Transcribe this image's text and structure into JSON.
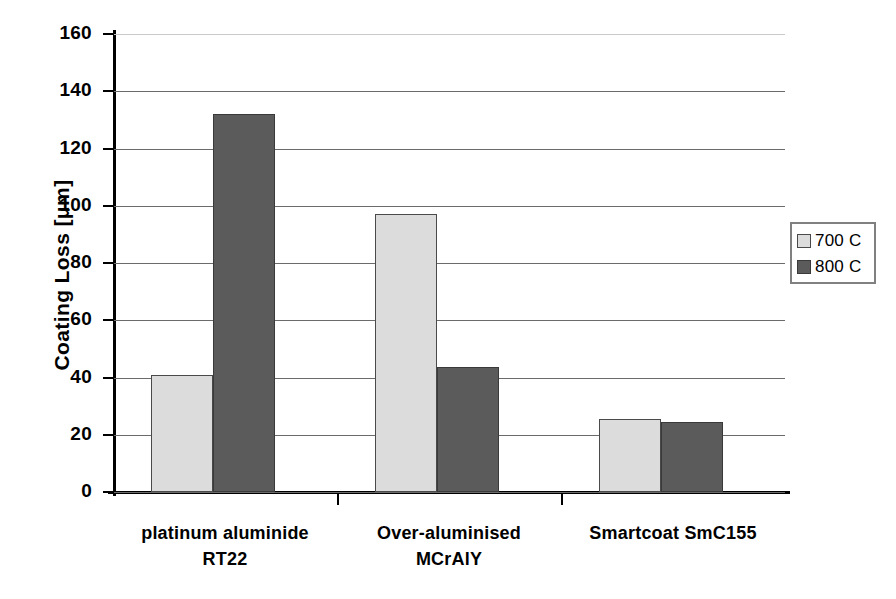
{
  "chart_data": {
    "type": "bar",
    "title": "",
    "xlabel": "",
    "ylabel": "Coating Loss [μm]",
    "categories": [
      "platinum aluminide\nRT22",
      "Over-aluminised\nMCrAlY",
      "Smartcoat SmC155"
    ],
    "series": [
      {
        "name": "700 C",
        "values": [
          41,
          97,
          25.5
        ],
        "color": "#dcdcdc"
      },
      {
        "name": "800 C",
        "values": [
          132,
          43.5,
          24.5
        ],
        "color": "#5b5b5b"
      }
    ],
    "ylim": [
      0,
      160
    ],
    "ytick_step": 20,
    "yticks": [
      "160",
      "140",
      "120",
      "100",
      "80",
      "60",
      "40",
      "20",
      "0"
    ],
    "grid": true,
    "legend_position": "right"
  },
  "legend": {
    "entries": [
      {
        "label": "700 C"
      },
      {
        "label": "800 C"
      }
    ]
  },
  "axes": {
    "y_title": "Coating Loss [μm]"
  }
}
